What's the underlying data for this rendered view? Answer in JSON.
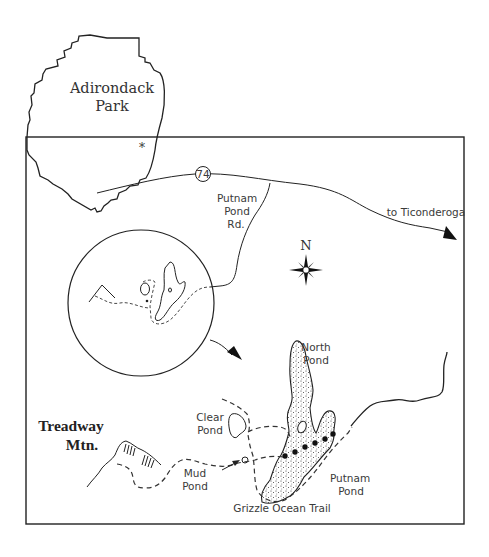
{
  "inset": {
    "region_label_line1": "Adirondack",
    "region_label_line2": "Park",
    "location_marker": "*"
  },
  "roads": {
    "route_number": "74",
    "side_road_line1": "Putnam",
    "side_road_line2": "Pond",
    "side_road_line3": "Rd.",
    "destination": "to Ticonderoga"
  },
  "compass": {
    "north_label": "N"
  },
  "features": {
    "mountain_line1": "Treadway",
    "mountain_line2": "Mtn.",
    "north_pond_line1": "North",
    "north_pond_line2": "Pond",
    "clear_pond_line1": "Clear",
    "clear_pond_line2": "Pond",
    "mud_pond_line1": "Mud",
    "mud_pond_line2": "Pond",
    "putnam_pond_line1": "Putnam",
    "putnam_pond_line2": "Pond",
    "trail_name": "Grizzle Ocean Trail"
  },
  "colors": {
    "ink": "#222222",
    "background": "#ffffff"
  }
}
